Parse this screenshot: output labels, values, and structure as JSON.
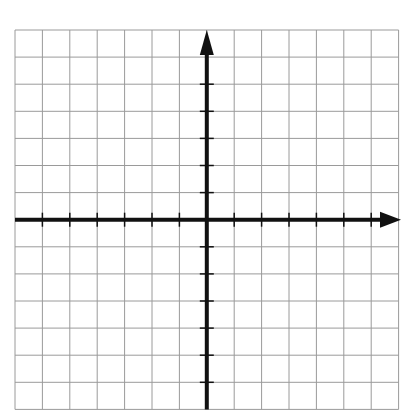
{
  "diagram": {
    "type": "coordinate-plane",
    "grid": {
      "columns": 14,
      "rows": 14,
      "left": 15,
      "top": 30,
      "cell_width": 27.4,
      "cell_height": 27.1,
      "line_color": "#9a9a9a",
      "background": "#ffffff"
    },
    "axes": {
      "color": "#111111",
      "origin_column": 7,
      "origin_row": 7,
      "x_axis": {
        "label": "",
        "arrow": "positive",
        "ticks_each_gridline": true
      },
      "y_axis": {
        "label": "",
        "arrow": "positive",
        "ticks_each_gridline": true
      }
    }
  }
}
